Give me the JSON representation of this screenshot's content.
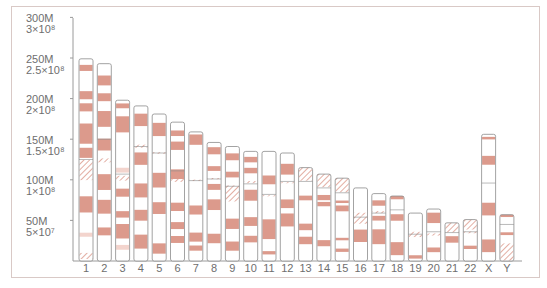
{
  "chart_data": {
    "type": "bar",
    "xlabel": "",
    "ylabel": "Base pairs",
    "ylim": [
      0,
      300000000
    ],
    "grid": false,
    "y_ticks": [
      {
        "value": 300000000,
        "label": "300M",
        "sci": "3×10⁸"
      },
      {
        "value": 250000000,
        "label": "250M",
        "sci": "2.5×10⁸"
      },
      {
        "value": 200000000,
        "label": "200M",
        "sci": "2×10⁸"
      },
      {
        "value": 150000000,
        "label": "150M",
        "sci": "1.5×10⁸"
      },
      {
        "value": 100000000,
        "label": "100M",
        "sci": "1×10⁸"
      },
      {
        "value": 50000000,
        "label": "50M",
        "sci": "5×10⁷"
      }
    ],
    "categories": [
      "1",
      "2",
      "3",
      "4",
      "5",
      "6",
      "7",
      "8",
      "9",
      "10",
      "11",
      "12",
      "13",
      "14",
      "15",
      "16",
      "17",
      "18",
      "19",
      "20",
      "21",
      "22",
      "X",
      "Y"
    ],
    "values_mbp": [
      249,
      243,
      198,
      191,
      181,
      171,
      159,
      146,
      141,
      135,
      135,
      133,
      115,
      107,
      102,
      90,
      83,
      80,
      59,
      64,
      47,
      51,
      156,
      57
    ],
    "centromere_mbp": [
      124,
      93,
      91,
      50,
      48,
      60,
      60,
      45,
      49,
      40,
      53,
      35,
      17,
      17,
      18,
      36,
      24,
      17,
      26,
      28,
      12,
      15,
      60,
      12
    ],
    "colors": {
      "band": "#dc9a8c",
      "light_band": "#f3d4cd",
      "outline": "#8c8c8c",
      "hatch": "#dc9a8c",
      "axis": "#9a9a9a",
      "frame": "#d9c9c6",
      "text": "#6e6e6e"
    }
  },
  "axis": {
    "labels": [
      {
        "main": "300M",
        "sub": "3×10⁸"
      },
      {
        "main": "250M",
        "sub": "2.5×10⁸"
      },
      {
        "main": "200M",
        "sub": "2×10⁸"
      },
      {
        "main": "150M",
        "sub": "1.5×10⁸"
      },
      {
        "main": "100M",
        "sub": "1×10⁸"
      },
      {
        "main": "50M",
        "sub": "5×10⁷"
      }
    ]
  }
}
